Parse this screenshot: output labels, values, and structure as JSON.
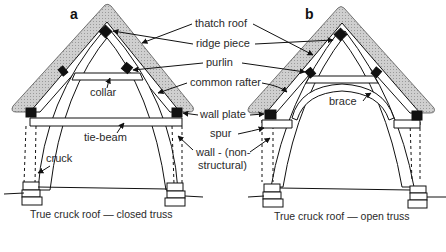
{
  "figure": {
    "panels": [
      {
        "id": "a",
        "letter": "a",
        "caption": "True cruck roof — closed truss"
      },
      {
        "id": "b",
        "letter": "b",
        "caption": "True cruck roof — open truss"
      }
    ],
    "center_labels": {
      "thatch_roof": "thatch roof",
      "ridge_piece": "ridge piece",
      "purlin": "purlin",
      "common_rafter": "common rafter",
      "wall_plate": "wall plate",
      "spur": "spur",
      "wall_line1": "wall - (non-",
      "wall_line2": "structural)"
    },
    "panel_a_labels": {
      "collar": "collar",
      "tie_beam": "tie-beam",
      "cruck": "cruck"
    },
    "panel_b_labels": {
      "brace": "brace"
    },
    "colors": {
      "thatch_fill": "#c8c8c8",
      "timber_fill": "#ffffff",
      "joint_block": "#111111",
      "line": "#111111",
      "text": "#2a2a2a"
    }
  }
}
